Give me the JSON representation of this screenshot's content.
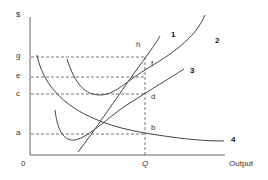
{
  "diagram": {
    "type": "cost-curves",
    "axes": {
      "y_label": "$",
      "x_label": "Output",
      "origin_label": "0",
      "x_marker": "Q"
    },
    "price_levels": [
      "g",
      "e",
      "c",
      "a"
    ],
    "points": [
      "h",
      "f",
      "d",
      "b"
    ],
    "curves": [
      {
        "id": "1",
        "label": "1"
      },
      {
        "id": "2",
        "label": "2"
      },
      {
        "id": "3",
        "label": "3"
      },
      {
        "id": "4",
        "label": "4"
      }
    ],
    "colors": {
      "line": "#444444",
      "dash": "#555555",
      "axis": "#666666"
    }
  }
}
